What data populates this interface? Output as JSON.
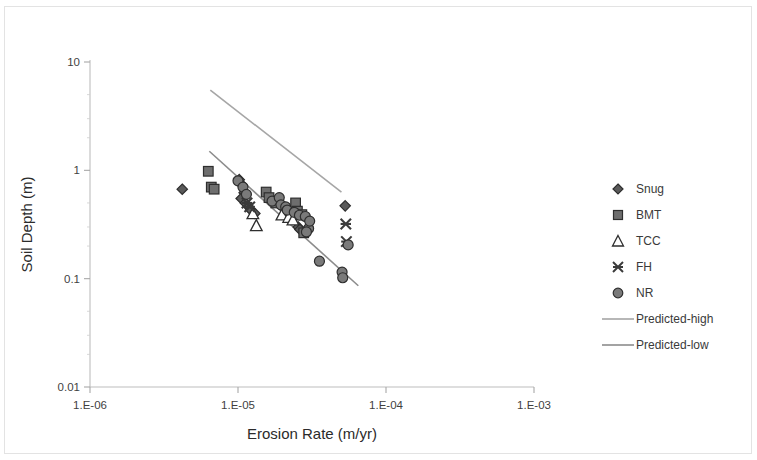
{
  "chart_data": {
    "type": "scatter",
    "title": "",
    "xlabel": "Erosion Rate (m/yr)",
    "ylabel": "Soil Depth (m)",
    "xscale": "log",
    "yscale": "log",
    "xlim": [
      1e-06,
      0.001
    ],
    "ylim": [
      0.01,
      10
    ],
    "grid": false,
    "legend_position": "right",
    "x_tick_labels": [
      "1.E-06",
      "1.E-05",
      "1.E-04",
      "1.E-03"
    ],
    "x_tick_values": [
      1e-06,
      1e-05,
      0.0001,
      0.001
    ],
    "y_tick_labels": [
      "10",
      "1",
      "0.1",
      "0.01"
    ],
    "y_tick_values": [
      10,
      1,
      0.1,
      0.01
    ],
    "series": [
      {
        "name": "Snug",
        "marker": "diamond",
        "color": "#5a5a5a",
        "points": [
          [
            4.2e-06,
            0.67
          ],
          [
            1.02e-05,
            0.82
          ],
          [
            1.06e-05,
            0.74
          ],
          [
            1.1e-05,
            0.62
          ],
          [
            1.05e-05,
            0.55
          ],
          [
            1.12e-05,
            0.5
          ],
          [
            1.18e-05,
            0.46
          ],
          [
            1.22e-05,
            0.43
          ],
          [
            1.3e-05,
            0.4
          ],
          [
            2.05e-05,
            0.44
          ],
          [
            2.3e-05,
            0.4
          ],
          [
            2.55e-05,
            0.3
          ],
          [
            2.62e-05,
            0.285
          ],
          [
            5.3e-05,
            0.47
          ]
        ]
      },
      {
        "name": "BMT",
        "marker": "square",
        "color": "#6e6e6e",
        "points": [
          [
            6.3e-06,
            0.98
          ],
          [
            6.6e-06,
            0.7
          ],
          [
            6.9e-06,
            0.67
          ],
          [
            1.55e-05,
            0.63
          ],
          [
            1.62e-05,
            0.56
          ],
          [
            1.8e-05,
            0.5
          ],
          [
            2.45e-05,
            0.5
          ],
          [
            2.52e-05,
            0.42
          ],
          [
            2.7e-05,
            0.39
          ],
          [
            2.78e-05,
            0.265
          ]
        ]
      },
      {
        "name": "TCC",
        "marker": "triangle",
        "color": "#ffffff",
        "points": [
          [
            1.26e-05,
            0.4
          ],
          [
            1.33e-05,
            0.31
          ],
          [
            1.98e-05,
            0.39
          ],
          [
            2.2e-05,
            0.37
          ],
          [
            2.35e-05,
            0.35
          ]
        ]
      },
      {
        "name": "FH",
        "marker": "x",
        "color": "#3a3a3a",
        "points": [
          [
            1.15e-05,
            0.5
          ],
          [
            1.2e-05,
            0.46
          ],
          [
            5.35e-05,
            0.32
          ],
          [
            5.4e-05,
            0.22
          ]
        ]
      },
      {
        "name": "NR",
        "marker": "circle",
        "color": "#7a7a7a",
        "points": [
          [
            1e-05,
            0.8
          ],
          [
            1.08e-05,
            0.7
          ],
          [
            1.14e-05,
            0.6
          ],
          [
            1.7e-05,
            0.52
          ],
          [
            1.9e-05,
            0.56
          ],
          [
            1.95e-05,
            0.48
          ],
          [
            2.1e-05,
            0.46
          ],
          [
            2.15e-05,
            0.43
          ],
          [
            2.4e-05,
            0.41
          ],
          [
            2.6e-05,
            0.385
          ],
          [
            2.85e-05,
            0.375
          ],
          [
            3e-05,
            0.29
          ],
          [
            3.05e-05,
            0.34
          ],
          [
            2.9e-05,
            0.27
          ],
          [
            3.55e-05,
            0.145
          ],
          [
            5.55e-05,
            0.205
          ],
          [
            5.05e-05,
            0.115
          ],
          [
            5.1e-05,
            0.102
          ]
        ]
      }
    ],
    "trendlines": [
      {
        "name": "Predicted-high",
        "color": "#a6a6a6",
        "x_start": 6.5e-06,
        "y_start": 5.5,
        "x_end": 5e-05,
        "y_end": 0.63
      },
      {
        "name": "Predicted-low",
        "color": "#8c8c8c",
        "x_start": 6.4e-06,
        "y_start": 1.5,
        "x_end": 6.5e-05,
        "y_end": 0.086
      }
    ]
  },
  "legend": {
    "items": [
      {
        "label": "Snug",
        "marker": "diamond"
      },
      {
        "label": "BMT",
        "marker": "square"
      },
      {
        "label": "TCC",
        "marker": "triangle"
      },
      {
        "label": "FH",
        "marker": "x"
      },
      {
        "label": "NR",
        "marker": "circle"
      },
      {
        "label": "Predicted-high",
        "marker": "line-light"
      },
      {
        "label": "Predicted-low",
        "marker": "line-dark"
      }
    ]
  },
  "axes": {
    "x_title": "Erosion Rate (m/yr)",
    "y_title": "Soil Depth (m)"
  }
}
